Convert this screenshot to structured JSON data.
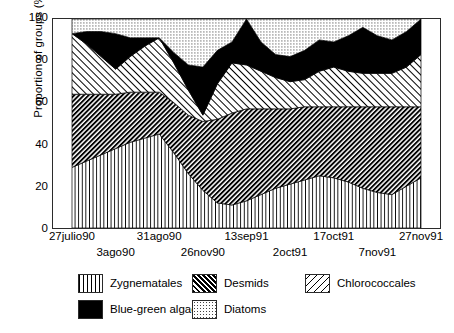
{
  "chart_data": {
    "type": "area",
    "stacked": true,
    "title": "",
    "xlabel": "",
    "ylabel": "Proportion of groups (%)",
    "ylim": [
      0,
      100
    ],
    "yticks": [
      0,
      20,
      40,
      60,
      80,
      100
    ],
    "grid": false,
    "legend_position": "bottom",
    "x_tick_labels": [
      {
        "label": "27julio90",
        "row": 0,
        "index": 0
      },
      {
        "label": "3ago90",
        "row": 1,
        "index": 3
      },
      {
        "label": "31ago90",
        "row": 0,
        "index": 6
      },
      {
        "label": "26nov90",
        "row": 1,
        "index": 9
      },
      {
        "label": "13sep91",
        "row": 0,
        "index": 12
      },
      {
        "label": "2oct91",
        "row": 1,
        "index": 15
      },
      {
        "label": "17oct91",
        "row": 0,
        "index": 18
      },
      {
        "label": "7nov91",
        "row": 1,
        "index": 21
      },
      {
        "label": "27nov91",
        "row": 0,
        "index": 24
      }
    ],
    "x": [
      0,
      1,
      2,
      3,
      4,
      5,
      6,
      7,
      8,
      9,
      10,
      11,
      12,
      13,
      14,
      15,
      16,
      17,
      18,
      19,
      20,
      21,
      22,
      23,
      24
    ],
    "series": [
      {
        "name": "Zygnematales",
        "pattern": "vertical-lines",
        "values": [
          29,
          32,
          35,
          38,
          41,
          43,
          45,
          36,
          26,
          18,
          12,
          11,
          13,
          16,
          19,
          21,
          23,
          25,
          24,
          22,
          19,
          17,
          16,
          20,
          24
        ]
      },
      {
        "name": "Desmids",
        "pattern": "dense-back-diagonal",
        "values": [
          35,
          32,
          29,
          26,
          24,
          22,
          20,
          24,
          28,
          33,
          40,
          44,
          44,
          41,
          38,
          36,
          35,
          33,
          34,
          36,
          39,
          41,
          42,
          38,
          34
        ]
      },
      {
        "name": "Chlorococcales",
        "pattern": "forward-diagonal",
        "values": [
          29,
          24,
          18,
          12,
          17,
          22,
          26,
          19,
          12,
          3,
          17,
          24,
          21,
          18,
          15,
          13,
          13,
          17,
          19,
          17,
          16,
          16,
          16,
          19,
          25
        ]
      },
      {
        "name": "Blue-green algae",
        "pattern": "solid-black",
        "values": [
          0,
          6,
          12,
          17,
          9,
          4,
          0,
          5,
          12,
          23,
          16,
          10,
          22,
          14,
          11,
          12,
          14,
          15,
          12,
          17,
          22,
          18,
          16,
          17,
          17
        ]
      },
      {
        "name": "Diatoms",
        "pattern": "fine-dots",
        "values": [
          7,
          6,
          6,
          7,
          9,
          9,
          9,
          16,
          22,
          23,
          15,
          11,
          0,
          11,
          17,
          18,
          15,
          10,
          11,
          8,
          4,
          8,
          10,
          6,
          0
        ]
      }
    ]
  },
  "axes": {
    "y_title": "Proportion of groups (%)",
    "y_ticks": [
      "100",
      "80",
      "60",
      "40",
      "20",
      "0"
    ]
  },
  "legend": {
    "items": [
      {
        "label": "Zygnematales",
        "swatch": "vertical-lines-swatch"
      },
      {
        "label": "Desmids",
        "swatch": "dense-back-diagonal-swatch"
      },
      {
        "label": "Chlorococcales",
        "swatch": "forward-diagonal-swatch"
      },
      {
        "label": "Blue-green algae",
        "swatch": "solid-black-swatch"
      },
      {
        "label": "Diatoms",
        "swatch": "fine-dots-swatch"
      }
    ]
  },
  "colors": {
    "ink": "#000000",
    "frame": "#2b2b2b",
    "background": "#ffffff"
  }
}
